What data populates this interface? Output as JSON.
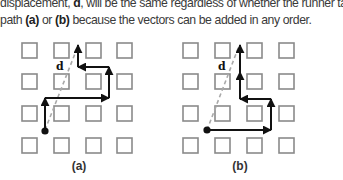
{
  "caption": {
    "line1_pre": "displacement, ",
    "line1_bold": "d",
    "line1_post": ", will be the same regardless of whether the runner takes",
    "line2_pre": "path ",
    "line2_bold_a": "(a)",
    "line2_mid": " or ",
    "line2_bold_b": "(b)",
    "line2_post": " because the vectors can be added in any order."
  },
  "figure": {
    "panels": [
      {
        "id": "a",
        "label": "(a)",
        "vector_label": "d"
      },
      {
        "id": "b",
        "label": "(b)",
        "vector_label": "d"
      }
    ],
    "colors": {
      "square_border": "#8a8a8a",
      "path": "#111111",
      "displacement_dashed": "#a9a9a9"
    }
  }
}
